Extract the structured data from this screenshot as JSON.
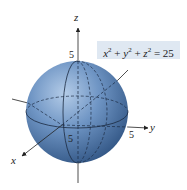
{
  "figure": {
    "equation": {
      "x": "x",
      "y": "y",
      "z": "z",
      "exp": "2",
      "plus": "+",
      "equals": "=",
      "rhs": "25"
    },
    "axes": {
      "x_label": "x",
      "y_label": "y",
      "z_label": "z"
    },
    "ticks": {
      "z_top": "5",
      "x_front": "5",
      "y_right": "5"
    },
    "sphere": {
      "radius": 5,
      "fill_color": "#4a74a8",
      "highlight_color": "#a9c4e3",
      "shadow_color": "#2c4f7c"
    },
    "label_box_color": "#dfe8f2"
  }
}
